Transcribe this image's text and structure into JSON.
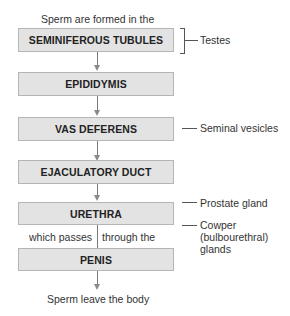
{
  "diagram": {
    "top_caption": "Sperm are formed in the",
    "bottom_caption": "Sperm leave the body",
    "boxes": [
      {
        "label": "SEMINIFEROUS TUBULES"
      },
      {
        "label": "EPIDIDYMIS"
      },
      {
        "label": "VAS DEFERENS"
      },
      {
        "label": "EJACULATORY DUCT"
      },
      {
        "label": "URETHRA"
      },
      {
        "label": "PENIS"
      }
    ],
    "connector_left": "which passes",
    "connector_right": "through the",
    "side_labels": {
      "testes": "Testes",
      "seminal_vesicles": "Seminal vesicles",
      "prostate": "Prostate gland",
      "cowper_line1": "Cowper",
      "cowper_line2": "(bulbourethral)",
      "cowper_line3": "glands"
    },
    "colors": {
      "box_fill": "#e3e3e3",
      "box_border": "#b5b5b5",
      "arrow": "#8a8a8a"
    }
  }
}
